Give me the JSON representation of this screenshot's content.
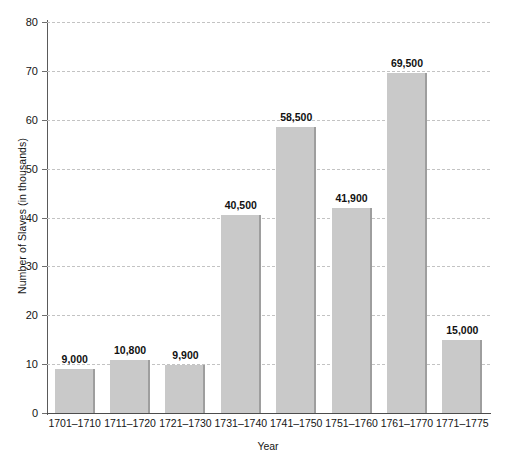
{
  "chart_data": {
    "type": "bar",
    "title": "",
    "xlabel": "Year",
    "ylabel": "Number of Slaves (in thousands)",
    "categories": [
      "1701–1710",
      "1711–1720",
      "1721–1730",
      "1731–1740",
      "1741–1750",
      "1751–1760",
      "1761–1770",
      "1771–1775"
    ],
    "values": [
      9,
      10.8,
      9.9,
      40.5,
      58.5,
      41.9,
      69.5,
      15
    ],
    "data_labels": [
      "9,000",
      "10,800",
      "9,900",
      "40,500",
      "58,500",
      "41,900",
      "69,500",
      "15,000"
    ],
    "ylim": [
      0,
      80
    ],
    "yticks": [
      0,
      10,
      20,
      30,
      40,
      50,
      60,
      70,
      80
    ],
    "ytick_labels": [
      "0",
      "10",
      "20",
      "30",
      "40",
      "50",
      "60",
      "70",
      "80"
    ],
    "grid": true,
    "legend": "none",
    "bar_color": "#c9c9c9",
    "bar_edge_color": "#9e9e9e",
    "gridline_color": "#c3c3c3",
    "axis_color": "#4d4d4d",
    "text_color": "#141414"
  }
}
